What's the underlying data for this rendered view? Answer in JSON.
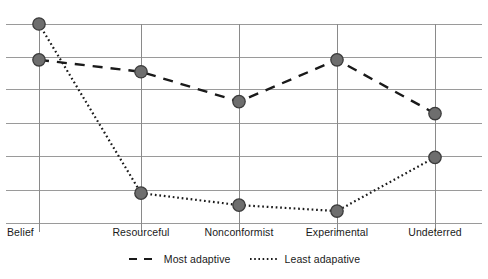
{
  "chart_data": {
    "type": "line",
    "title": "",
    "subtitle": "",
    "xlabel": "",
    "ylabel": "",
    "categories": [
      "Belief",
      "Resourceful",
      "Nonconformist",
      "Experimental",
      "Undeterred"
    ],
    "series": [
      {
        "name": "Most adaptive",
        "style": "dashed",
        "values": [
          82,
          76,
          61,
          82,
          55
        ]
      },
      {
        "name": "Least adapative",
        "style": "dotted",
        "values": [
          100,
          15,
          9,
          6,
          33
        ]
      }
    ],
    "ylim": [
      0,
      100
    ],
    "gridlines": [
      0,
      16.5,
      33.5,
      50,
      67,
      83,
      100
    ],
    "grid": true,
    "legend_position": "bottom",
    "axis_tick_marks": true,
    "marker": "circle",
    "colors": {
      "marker_fill": "#6e6e6e",
      "marker_stroke": "#3c3c3c",
      "series_line": "#1a1a1a",
      "grid": "#9a9a9a",
      "axis": "#8a8a8a",
      "text": "#1a1a1a"
    }
  },
  "legend": {
    "entries": [
      {
        "label": "Most adaptive",
        "icon": "dashed-line-swatch"
      },
      {
        "label": "Least adapative",
        "icon": "dotted-line-swatch"
      }
    ]
  },
  "x_axis": {
    "tick_labels": [
      "Belief",
      "Resourceful",
      "Nonconformist",
      "Experimental",
      "Undeterred"
    ]
  }
}
